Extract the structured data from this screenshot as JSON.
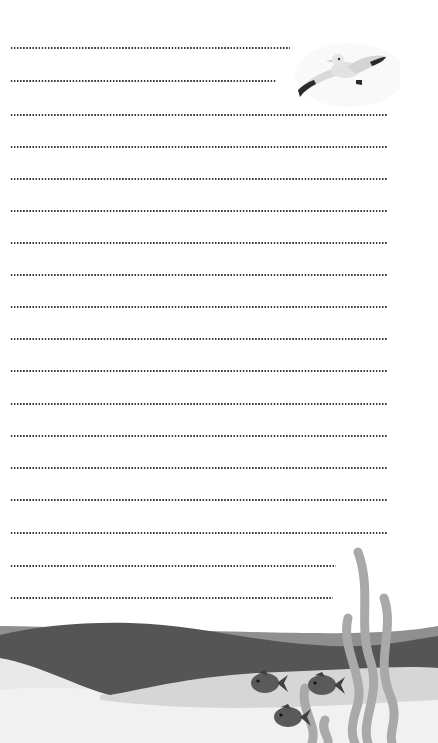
{
  "page": {
    "type": "lined writing paper",
    "theme": "ocean",
    "background": "#ffffff"
  },
  "colors": {
    "dots": "#3a3a3a",
    "wave_dark": "#555555",
    "wave_mid": "#8f8f8f",
    "wave_light": "#cfcfcf",
    "sand": "#e8e8e8",
    "seaweed": "#a9a9a9",
    "fish": "#5a5a5a",
    "gull_body": "#dedede",
    "gull_wingtip": "#2b2b2b"
  },
  "lines": [
    {
      "y": 48,
      "end_x": 290
    },
    {
      "y": 81,
      "end_x": 276
    },
    {
      "y": 115,
      "end_x": 388
    },
    {
      "y": 147,
      "end_x": 388
    },
    {
      "y": 179,
      "end_x": 388
    },
    {
      "y": 211,
      "end_x": 388
    },
    {
      "y": 243,
      "end_x": 388
    },
    {
      "y": 275,
      "end_x": 388
    },
    {
      "y": 307,
      "end_x": 388
    },
    {
      "y": 339,
      "end_x": 388
    },
    {
      "y": 371,
      "end_x": 388
    },
    {
      "y": 404,
      "end_x": 388
    },
    {
      "y": 436,
      "end_x": 388
    },
    {
      "y": 468,
      "end_x": 388
    },
    {
      "y": 500,
      "end_x": 388
    },
    {
      "y": 533,
      "end_x": 388
    },
    {
      "y": 566,
      "end_x": 336
    },
    {
      "y": 598,
      "end_x": 333
    }
  ],
  "illustrations": {
    "seagull": "seagull-icon",
    "fish_count": 3,
    "seaweed": "seaweed-icon",
    "waves": "wave-decoration"
  }
}
